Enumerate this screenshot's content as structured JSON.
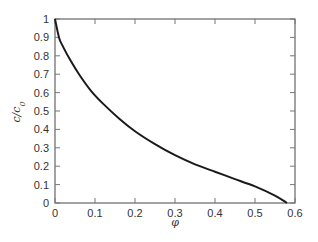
{
  "chart_data": {
    "type": "line",
    "title": "",
    "xlabel": "φ",
    "ylabel": "c/c0",
    "xlim": [
      0,
      0.6
    ],
    "ylim": [
      0,
      1
    ],
    "grid": false,
    "legend": null,
    "x_ticks": [
      "0",
      "0.1",
      "0.2",
      "0.3",
      "0.4",
      "0.5",
      "0.6"
    ],
    "y_ticks": [
      "0",
      "0.1",
      "0.2",
      "0.3",
      "0.4",
      "0.5",
      "0.6",
      "0.7",
      "0.8",
      "0.9",
      "1"
    ],
    "series": [
      {
        "name": "c/c0 vs φ",
        "color": "#1a1a1a",
        "x": [
          0,
          0.01,
          0.02,
          0.04,
          0.06,
          0.09,
          0.12,
          0.16,
          0.2,
          0.25,
          0.3,
          0.35,
          0.4,
          0.45,
          0.5,
          0.55,
          0.58
        ],
        "y": [
          1,
          0.9,
          0.85,
          0.77,
          0.7,
          0.61,
          0.54,
          0.46,
          0.39,
          0.32,
          0.26,
          0.21,
          0.17,
          0.13,
          0.09,
          0.04,
          0
        ]
      }
    ]
  }
}
